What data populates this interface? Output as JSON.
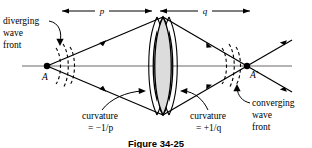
{
  "figure": {
    "caption": "Figure 34-25",
    "dimensions": [
      {
        "name": "object-distance",
        "label": "p"
      },
      {
        "name": "image-distance",
        "label": "q"
      }
    ],
    "points": [
      {
        "name": "object-point",
        "label": "A"
      },
      {
        "name": "image-point",
        "label": "A′"
      }
    ],
    "annotations": [
      {
        "name": "diverging-wavefront",
        "lines": [
          "diverging",
          "wave",
          "front"
        ]
      },
      {
        "name": "converging-wavefront",
        "lines": [
          "converging",
          "wave",
          "front"
        ]
      },
      {
        "name": "curvature-left",
        "lines": [
          "curvature",
          "= −1/p"
        ]
      },
      {
        "name": "curvature-right",
        "lines": [
          "curvature",
          "= +1/q"
        ]
      }
    ],
    "colors": {
      "ink": "#000000",
      "axis": "#6b6b6b",
      "lens_fill": "#dcdcdc",
      "background": "#ffffff"
    }
  }
}
